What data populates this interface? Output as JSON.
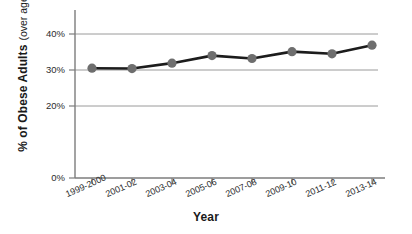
{
  "chart_data": {
    "type": "line",
    "title": "",
    "xlabel": "Year",
    "ylabel": "% of Obese Adults",
    "ylabel_sub": "(over age 20)",
    "categories": [
      "1999-2000",
      "2001-02",
      "2003-04",
      "2005-06",
      "2007-08",
      "2009-10",
      "2011-12",
      "2013-14"
    ],
    "values": [
      30.5,
      30.4,
      31.9,
      34.0,
      33.2,
      35.1,
      34.5,
      36.9
    ],
    "ylim": [
      0,
      40
    ],
    "yticks": [
      0,
      20,
      30,
      40
    ],
    "ytick_labels": [
      "0%",
      "20%",
      "30%",
      "40%"
    ],
    "grid": true,
    "grid_axis": "y",
    "legend": "none",
    "series": [
      {
        "name": "% of Obese Adults (over age 20)",
        "values": [
          30.5,
          30.4,
          31.9,
          34.0,
          33.2,
          35.1,
          34.5,
          36.9
        ]
      }
    ],
    "colors": {
      "line": "#1c1c1c",
      "marker": "#6e6e6e",
      "grid": "#9a9a9a",
      "axis": "#7c7c7c",
      "text": "#1a1a1a",
      "background": "#ffffff"
    }
  }
}
